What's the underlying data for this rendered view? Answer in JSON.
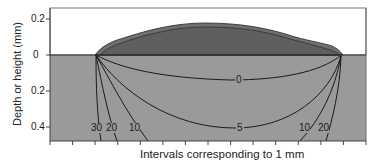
{
  "figure": {
    "y_axis_label": "Depth or height (mm)",
    "x_axis_label": "Intervals corresponding to 1 mm",
    "y_ticks": [
      {
        "label": "0.2",
        "side": "height"
      },
      {
        "label": "0",
        "side": "surface"
      },
      {
        "label": "0.2",
        "side": "depth"
      },
      {
        "label": "0.4",
        "side": "depth"
      }
    ],
    "x_tick_count": 15,
    "contour_labels": {
      "c0": "0",
      "c5": "5",
      "c10_left": "10",
      "c20_left": "20",
      "c30_left": "30",
      "c10_right": "10",
      "c20_right": "20"
    },
    "colors": {
      "substrate": "#9a9a9a",
      "bead_outer": "#6f6f6f",
      "bead_inner": "#5e5e5e",
      "air": "#ffffff",
      "lines": "#1a1a1a"
    }
  }
}
